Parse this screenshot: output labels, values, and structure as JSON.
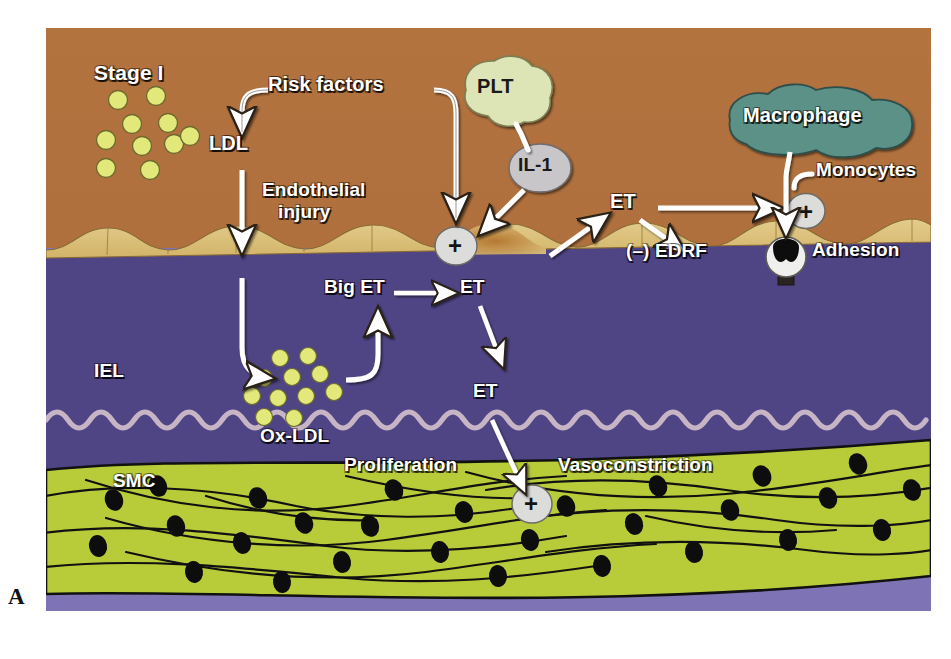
{
  "figure": {
    "panel_label": "A",
    "stage_label": "Stage I",
    "palette": {
      "lumen_brown": "#b0703f",
      "endothelium_tan": "#ddc27d",
      "endothelium_shadow": "#c79a4b",
      "intima_purple": "#4f4585",
      "iel_line": "#c7b5c6",
      "smc_green": "#b8cc3a",
      "media_gray": "#a8a095",
      "adventitia_purple": "#7e74b5",
      "ldl_yellow": "#e2e87a",
      "plt_green": "#dde5b6",
      "il1_gray": "#c9c6c9",
      "macrophage_teal": "#5b9188",
      "plus_circle": "#dcdcda",
      "arrow_white": "#ffffff",
      "outline_black": "#1a1a1a"
    }
  },
  "labels": {
    "stage": "Stage I",
    "risk_factors": "Risk factors",
    "ldl": "LDL",
    "endothelial_injury_line1": "Endothelial",
    "endothelial_injury_line2": "injury",
    "plt": "PLT",
    "il1": "IL-1",
    "et_lumen": "ET",
    "edrf": "(–) EDRF",
    "macrophage": "Macrophage",
    "monocytes": "Monocytes",
    "adhesion": "Adhesion",
    "big_et": "Big ET",
    "et_endothelium": "ET",
    "iel": "IEL",
    "ox_ldl": "Ox-LDL",
    "et_intima": "ET",
    "proliferation": "Proliferation",
    "vasoconstriction": "Vasoconstriction",
    "smc": "SMC",
    "plus_sign": "+"
  },
  "nodes": [
    {
      "id": "risk-factors",
      "label": "Risk factors",
      "kind": "text"
    },
    {
      "id": "ldl",
      "label": "LDL",
      "kind": "text"
    },
    {
      "id": "endothelial-injury",
      "label": "Endothelial injury",
      "kind": "text"
    },
    {
      "id": "plt",
      "label": "PLT",
      "kind": "blob",
      "fill": "#dde5b6"
    },
    {
      "id": "il1",
      "label": "IL-1",
      "kind": "ellipse",
      "fill": "#c9c6c9"
    },
    {
      "id": "macrophage",
      "label": "Macrophage",
      "kind": "blob",
      "fill": "#5b9188"
    },
    {
      "id": "monocytes",
      "label": "Monocytes",
      "kind": "text"
    },
    {
      "id": "adhesion",
      "label": "Adhesion",
      "kind": "text"
    },
    {
      "id": "big-et",
      "label": "Big ET",
      "kind": "text"
    },
    {
      "id": "et-endothelium",
      "label": "ET",
      "kind": "text"
    },
    {
      "id": "et-lumen",
      "label": "ET",
      "kind": "text"
    },
    {
      "id": "edrf",
      "label": "(–) EDRF",
      "kind": "text"
    },
    {
      "id": "ox-ldl",
      "label": "Ox-LDL",
      "kind": "text"
    },
    {
      "id": "et-intima",
      "label": "ET",
      "kind": "text"
    },
    {
      "id": "iel",
      "label": "IEL",
      "kind": "text"
    },
    {
      "id": "smc",
      "label": "SMC",
      "kind": "text"
    },
    {
      "id": "proliferation",
      "label": "Proliferation",
      "kind": "text"
    },
    {
      "id": "vasoconstriction",
      "label": "Vasoconstriction",
      "kind": "text"
    }
  ],
  "plus_nodes": [
    {
      "id": "plus-endothelial-activation",
      "label": "+"
    },
    {
      "id": "plus-adhesion-activation",
      "label": "+"
    },
    {
      "id": "plus-smc-activation",
      "label": "+"
    }
  ],
  "edges": [
    {
      "from": "risk-factors",
      "to": "ldl"
    },
    {
      "from": "risk-factors",
      "to": "plus-endothelial-activation"
    },
    {
      "from": "ldl",
      "to": "endothelial-injury"
    },
    {
      "from": "plt",
      "to": "il1"
    },
    {
      "from": "il1",
      "to": "plus-endothelial-activation"
    },
    {
      "from": "plus-endothelial-activation",
      "to": "et-lumen"
    },
    {
      "from": "et-lumen",
      "to": "plus-adhesion-activation"
    },
    {
      "from": "et-lumen",
      "to": "edrf"
    },
    {
      "from": "macrophage",
      "to": "adhesion"
    },
    {
      "from": "endothelial-injury",
      "to": "ox-ldl"
    },
    {
      "from": "big-et",
      "to": "et-endothelium"
    },
    {
      "from": "ox-ldl",
      "to": "big-et"
    },
    {
      "from": "et-endothelium",
      "to": "et-intima"
    },
    {
      "from": "et-intima",
      "to": "plus-smc-activation"
    }
  ]
}
